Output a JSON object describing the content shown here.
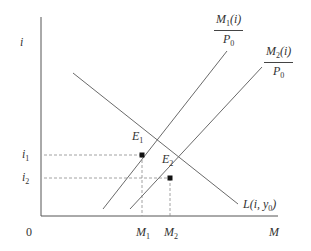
{
  "diagram": {
    "type": "money-market-equilibrium",
    "axes": {
      "y_label": "i",
      "x_label": "M",
      "origin_label": "0"
    },
    "curves": [
      {
        "id": "L",
        "label_main": "L(i, y",
        "label_sub": "0",
        "label_close": ")",
        "description": "money demand"
      },
      {
        "id": "M1",
        "num_main": "M",
        "num_sub": "1",
        "num_rest": "(i)",
        "den_main": "P",
        "den_sub": "0",
        "description": "real money supply 1"
      },
      {
        "id": "M2",
        "num_main": "M",
        "num_sub": "2",
        "num_rest": "(i)",
        "den_main": "P",
        "den_sub": "0",
        "description": "real money supply 2"
      }
    ],
    "points": [
      {
        "id": "E1",
        "main": "E",
        "sub": "1"
      },
      {
        "id": "E2",
        "main": "E",
        "sub": "2"
      }
    ],
    "y_ticks": [
      {
        "main": "i",
        "sub": "1"
      },
      {
        "main": "i",
        "sub": "2"
      }
    ],
    "x_ticks": [
      {
        "main": "M",
        "sub": "1"
      },
      {
        "main": "M",
        "sub": "2"
      }
    ],
    "colors": {
      "axis": "#555555",
      "curve": "#6a6a6a",
      "dashed": "#8a8a8a",
      "point": "#111111"
    }
  }
}
